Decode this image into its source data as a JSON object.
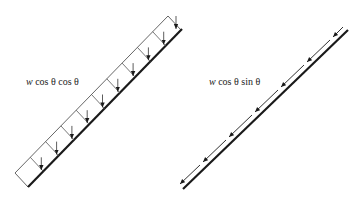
{
  "diagram": {
    "left_panel": {
      "label": "w cos θ  cos θ",
      "label_parts": {
        "var": "w",
        "rest": " cos θ  cos θ"
      },
      "description": "Distributed load strip along inclined member with vertical downward arrows",
      "cells": 10,
      "arrow_direction": "down"
    },
    "right_panel": {
      "label": "w cos θ  sin θ",
      "label_parts": {
        "var": "w",
        "rest": " cos θ  sin θ"
      },
      "description": "Inclined member with parallel dashed arrows pointing down-left along the member",
      "arrows": 7,
      "arrow_direction": "down-left along member"
    },
    "colors": {
      "line": "#1a1a1a",
      "thin_line": "#555555",
      "background": "#ffffff"
    }
  }
}
